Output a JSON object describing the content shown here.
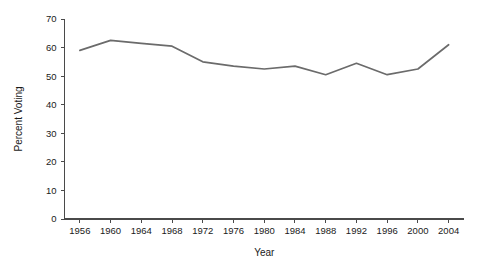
{
  "chart_data": {
    "type": "line",
    "title": "",
    "subtitle": "",
    "xlabel": "Year",
    "ylabel": "Percent Voting",
    "x": [
      1956,
      1960,
      1964,
      1968,
      1972,
      1976,
      1980,
      1984,
      1988,
      1992,
      1996,
      2000,
      2004
    ],
    "categories": [
      "1956",
      "1960",
      "1964",
      "1968",
      "1972",
      "1976",
      "1980",
      "1984",
      "1988",
      "1992",
      "1996",
      "2000",
      "2004"
    ],
    "values": [
      59.0,
      62.5,
      61.5,
      60.5,
      55.0,
      53.5,
      52.5,
      53.5,
      50.5,
      54.5,
      50.5,
      52.5,
      61.0
    ],
    "series": [
      {
        "name": "Percent Voting",
        "color": "#6b6b6b",
        "values": [
          59.0,
          62.5,
          61.5,
          60.5,
          55.0,
          53.5,
          52.5,
          53.5,
          50.5,
          54.5,
          50.5,
          52.5,
          61.0
        ]
      }
    ],
    "xlim": [
      1954,
      2006
    ],
    "ylim": [
      0,
      70
    ],
    "yticks": [
      0,
      10,
      20,
      30,
      40,
      50,
      60,
      70
    ],
    "ytick_labels": [
      "0",
      "10",
      "20",
      "30",
      "40",
      "50",
      "60",
      "70"
    ],
    "xticks": [
      1956,
      1960,
      1964,
      1968,
      1972,
      1976,
      1980,
      1984,
      1988,
      1992,
      1996,
      2000,
      2004
    ],
    "xtick_labels": [
      "1956",
      "1960",
      "1964",
      "1968",
      "1972",
      "1976",
      "1980",
      "1984",
      "1988",
      "1992",
      "1996",
      "2000",
      "2004"
    ],
    "grid": false,
    "legend": false,
    "legend_position": "none",
    "annotations": [],
    "line_color": "#6b6b6b",
    "axis_color": "#4a4a4a",
    "background_color": "#ffffff"
  }
}
